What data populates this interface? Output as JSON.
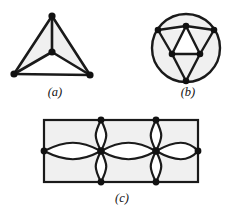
{
  "plate": {
    "title": "Graph embedding figure plate",
    "background_color": "#ffffff",
    "edge_color": "#1a1a1a",
    "vertex_color": "#111111",
    "face_fill_color": "#f0f0f0",
    "figure_count": 3
  },
  "figures": [
    {
      "id": "a",
      "caption": "(a)",
      "kind": "planar-graph",
      "description": "tetrahedron K4 drawn as triangle with interior central vertex",
      "vertex_count": 4,
      "edge_count": 6,
      "vertices": [
        {
          "name": "apex",
          "x": 52,
          "y": 14
        },
        {
          "name": "bottom-left",
          "x": 14,
          "y": 72
        },
        {
          "name": "bottom-right",
          "x": 90,
          "y": 73
        },
        {
          "name": "center",
          "x": 52,
          "y": 50
        }
      ],
      "edges": [
        [
          "apex",
          "bottom-left"
        ],
        [
          "apex",
          "bottom-right"
        ],
        [
          "bottom-left",
          "bottom-right"
        ],
        [
          "center",
          "apex"
        ],
        [
          "center",
          "bottom-left"
        ],
        [
          "center",
          "bottom-right"
        ]
      ]
    },
    {
      "id": "b",
      "caption": "(b)",
      "kind": "planar-graph-in-circle",
      "description": "octahedron K2,2,2 drawn inside a circle with six vertices",
      "vertex_count": 6,
      "edge_count": 12,
      "circle": {
        "cx": 54,
        "cy": 46,
        "r": 34
      },
      "vertices": [
        {
          "name": "top-left",
          "x": 26,
          "y": 28
        },
        {
          "name": "top-center",
          "x": 54,
          "y": 24
        },
        {
          "name": "top-right",
          "x": 82,
          "y": 28
        },
        {
          "name": "mid-left",
          "x": 40,
          "y": 52
        },
        {
          "name": "mid-right",
          "x": 68,
          "y": 52
        },
        {
          "name": "bottom",
          "x": 54,
          "y": 79
        }
      ],
      "edges": [
        [
          "top-left",
          "top-center"
        ],
        [
          "top-center",
          "top-right"
        ],
        [
          "top-left",
          "mid-left"
        ],
        [
          "top-center",
          "mid-left"
        ],
        [
          "top-center",
          "mid-right"
        ],
        [
          "top-right",
          "mid-right"
        ],
        [
          "mid-left",
          "mid-right"
        ],
        [
          "mid-left",
          "bottom"
        ],
        [
          "mid-right",
          "bottom"
        ],
        [
          "top-left",
          "bottom"
        ],
        [
          "top-right",
          "bottom"
        ]
      ]
    },
    {
      "id": "c",
      "caption": "(c)",
      "kind": "multigraph-in-rectangle",
      "description": "rectangle with four vertices on boundary joined by pairs of curved lens edges",
      "vertex_count": 6,
      "rectangle": {
        "x": 28,
        "y": 14,
        "width": 154,
        "height": 62
      },
      "vertices": [
        {
          "name": "left-mid",
          "x": 28,
          "y": 45
        },
        {
          "name": "inner-left",
          "x": 85,
          "y": 45
        },
        {
          "name": "inner-right",
          "x": 140,
          "y": 45
        },
        {
          "name": "right-mid",
          "x": 182,
          "y": 45
        },
        {
          "name": "top-left-v",
          "x": 85,
          "y": 14
        },
        {
          "name": "top-right-v",
          "x": 140,
          "y": 14
        },
        {
          "name": "bot-left-v",
          "x": 85,
          "y": 76
        },
        {
          "name": "bot-right-v",
          "x": 140,
          "y": 76
        }
      ]
    }
  ]
}
